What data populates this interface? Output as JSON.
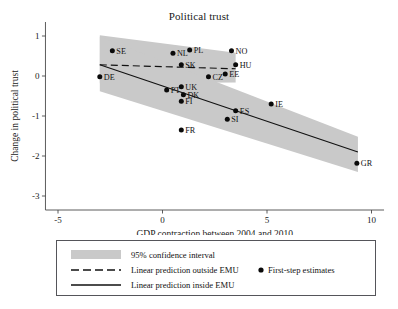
{
  "chart_data": {
    "type": "scatter",
    "title": "Political trust",
    "xlabel": "GDP contraction between 2004 and 2010",
    "ylabel": "Change in political trust",
    "xlim": [
      -5.6,
      10.6
    ],
    "ylim": [
      -3.35,
      1.35
    ],
    "xticks": [
      -5,
      0,
      5,
      10
    ],
    "xticklabels": [
      "-5",
      "0",
      "5",
      "10"
    ],
    "yticks": [
      1,
      0,
      -1,
      -2,
      -3
    ],
    "yticklabels": [
      "1",
      "0",
      "-1",
      "-2",
      "-3"
    ],
    "grid": false,
    "legend_position": "below-axes",
    "points": [
      {
        "label": "SE",
        "x": -2.4,
        "y": 0.63
      },
      {
        "label": "DE",
        "x": -3.0,
        "y": -0.02
      },
      {
        "label": "NL",
        "x": 0.5,
        "y": 0.57
      },
      {
        "label": "PL",
        "x": 1.3,
        "y": 0.65
      },
      {
        "label": "NO",
        "x": 3.3,
        "y": 0.63
      },
      {
        "label": "SK",
        "x": 0.9,
        "y": 0.28
      },
      {
        "label": "HU",
        "x": 3.5,
        "y": 0.28
      },
      {
        "label": "CZ",
        "x": 2.2,
        "y": -0.02
      },
      {
        "label": "EE",
        "x": 3.0,
        "y": 0.05
      },
      {
        "label": "PT",
        "x": 0.2,
        "y": -0.35
      },
      {
        "label": "UK",
        "x": 0.9,
        "y": -0.27
      },
      {
        "label": "DK",
        "x": 1.0,
        "y": -0.47
      },
      {
        "label": "FI",
        "x": 0.9,
        "y": -0.63
      },
      {
        "label": "FR",
        "x": 0.9,
        "y": -1.35
      },
      {
        "label": "ES",
        "x": 3.5,
        "y": -0.87
      },
      {
        "label": "SI",
        "x": 3.1,
        "y": -1.08
      },
      {
        "label": "IE",
        "x": 5.2,
        "y": -0.7
      },
      {
        "label": "GR",
        "x": 9.3,
        "y": -2.18
      }
    ],
    "series": [
      {
        "name": "Linear prediction outside EMU",
        "style": "dashed",
        "x_start": -3.0,
        "x_end": 3.5,
        "y_start": 0.28,
        "y_end": 0.18,
        "ci_upper_start": 1.02,
        "ci_upper_end": 0.58,
        "ci_lower_start": -0.18,
        "ci_lower_end": -0.16
      },
      {
        "name": "Linear prediction inside EMU",
        "style": "solid",
        "x_start": -3.0,
        "x_end": 9.35,
        "y_start": 0.28,
        "y_end": -1.9,
        "ci_upper_start": 0.98,
        "ci_upper_end": -1.52,
        "ci_lower_start": -0.38,
        "ci_lower_end": -2.4
      }
    ]
  },
  "legend": {
    "items": [
      {
        "key": "ci",
        "label": "95% confidence interval",
        "marker": "band-swatch"
      },
      {
        "key": "outside",
        "label": "Linear prediction outside EMU",
        "marker": "dashed-line"
      },
      {
        "key": "inside",
        "label": "Linear prediction inside EMU",
        "marker": "solid-line"
      },
      {
        "key": "points",
        "label": "First-step estimates",
        "marker": "dot"
      }
    ]
  },
  "colors": {
    "confidence_band": "#c9c9c9",
    "line": "#111111",
    "point": "#0a0a0a",
    "axis": "#4a4a4a",
    "legend_border": "#55555a"
  }
}
